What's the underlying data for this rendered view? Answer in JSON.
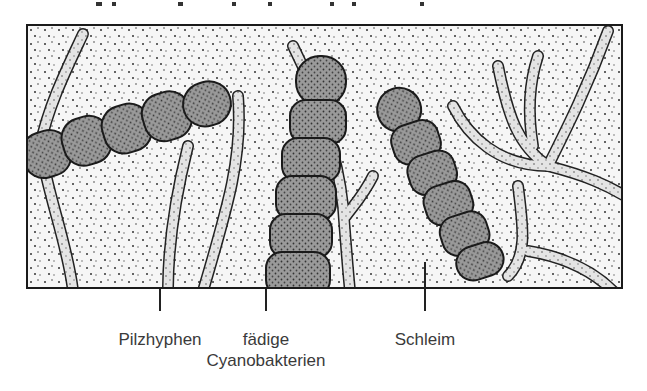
{
  "figure": {
    "title_cut_off": true,
    "labels": [
      {
        "id": "pilzhyphen",
        "text": "Pilzhyphen",
        "x": 160
      },
      {
        "id": "cyanobakterien",
        "line1": "fädige",
        "line2": "Cyanobakterien",
        "x": 266
      },
      {
        "id": "schleim",
        "text": "Schleim",
        "x": 425
      }
    ],
    "colors": {
      "frame": "#1a1a1a",
      "background_stipple": "#f4f4f4",
      "label_text": "#3a3a3a",
      "cyanobacteria_fill": "#8a8a8a",
      "hyphae_fill": "#d2d2d2"
    }
  }
}
